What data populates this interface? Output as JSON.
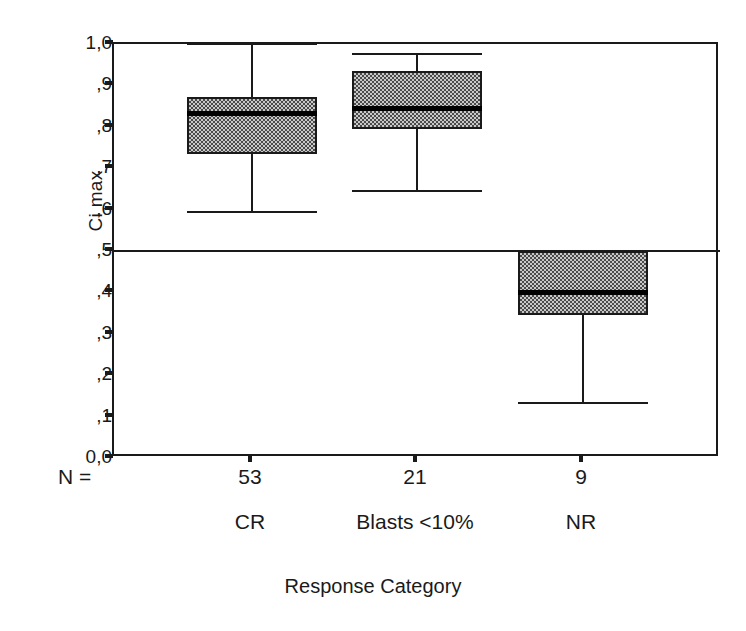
{
  "chart_data": {
    "type": "box",
    "title": "",
    "xlabel": "Response Category",
    "ylabel": "Ci max",
    "ylim": [
      0.0,
      1.0
    ],
    "grid": false,
    "legend": "none",
    "y_tick_labels": [
      "1,0",
      ",9",
      ",8",
      ",7",
      ",6",
      ",5",
      ",4",
      ",3",
      ",2",
      ",1",
      "0,0"
    ],
    "y_tick_values": [
      1.0,
      0.9,
      0.8,
      0.7,
      0.6,
      0.5,
      0.4,
      0.3,
      0.2,
      0.1,
      0.0
    ],
    "n_label": "N =",
    "reference_line": 0.5,
    "categories": [
      "CR",
      "Blasts <10%",
      "NR"
    ],
    "counts": [
      "53",
      "21",
      "9"
    ],
    "boxes": [
      {
        "category": "CR",
        "n": "53",
        "whisker_low": 0.595,
        "q1": 0.735,
        "median": 0.833,
        "q3": 0.872,
        "whisker_high": 1.0
      },
      {
        "category": "Blasts <10%",
        "n": "21",
        "whisker_low": 0.645,
        "q1": 0.795,
        "median": 0.845,
        "q3": 0.935,
        "whisker_high": 0.975
      },
      {
        "category": "NR",
        "n": "9",
        "whisker_low": 0.133,
        "q1": 0.345,
        "median": 0.4,
        "q3": 0.5,
        "whisker_high": 0.5
      }
    ]
  },
  "colors": {
    "axis": "#1a1a1a",
    "box_fill": "#c8c8c8",
    "box_pattern": "#4a4a4a",
    "median": "#000000",
    "background": "#ffffff"
  }
}
